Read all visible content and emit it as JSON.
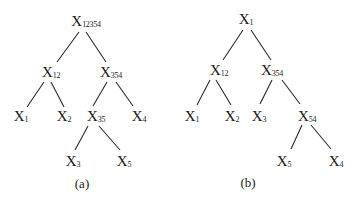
{
  "figure": {
    "trees": [
      {
        "caption": "(a)",
        "nodes": {
          "root": {
            "base": "X",
            "sub": "12354"
          },
          "n12": {
            "base": "X",
            "sub": "12"
          },
          "n354": {
            "base": "X",
            "sub": "354"
          },
          "x1": {
            "base": "X",
            "sub": "1"
          },
          "x2": {
            "base": "X",
            "sub": "2"
          },
          "n35": {
            "base": "X",
            "sub": "35"
          },
          "x4": {
            "base": "X",
            "sub": "4"
          },
          "x3": {
            "base": "X",
            "sub": "3"
          },
          "x5": {
            "base": "X",
            "sub": "5"
          }
        }
      },
      {
        "caption": "(b)",
        "nodes": {
          "root": {
            "base": "X",
            "sub": "1"
          },
          "n12": {
            "base": "X",
            "sub": "12"
          },
          "n354": {
            "base": "X",
            "sub": "354"
          },
          "x1": {
            "base": "X",
            "sub": "1"
          },
          "x2": {
            "base": "X",
            "sub": "2"
          },
          "x3": {
            "base": "X",
            "sub": "3"
          },
          "n54": {
            "base": "X",
            "sub": "54"
          },
          "x5": {
            "base": "X",
            "sub": "5"
          },
          "x4": {
            "base": "X",
            "sub": "4"
          }
        }
      }
    ]
  }
}
